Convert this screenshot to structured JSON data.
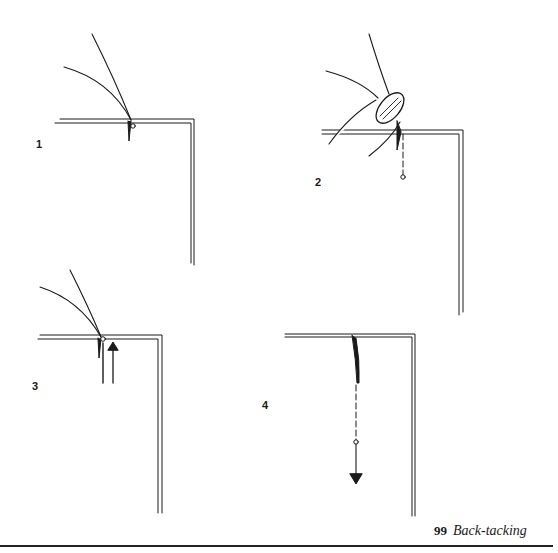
{
  "figure": {
    "number": "99",
    "title": "Back-tacking",
    "stroke_color": "#1a1a1a",
    "background_color": "#ffffff"
  },
  "steps": [
    {
      "label": "1",
      "description": "Needle inserted at corner of fold with threads above"
    },
    {
      "label": "2",
      "description": "Fingertip holds needle; stitch line dashed downward to point"
    },
    {
      "label": "3",
      "description": "Needle with upward arrow back along stitch"
    },
    {
      "label": "4",
      "description": "Needle drawn down along dashed line, downward arrow"
    }
  ]
}
